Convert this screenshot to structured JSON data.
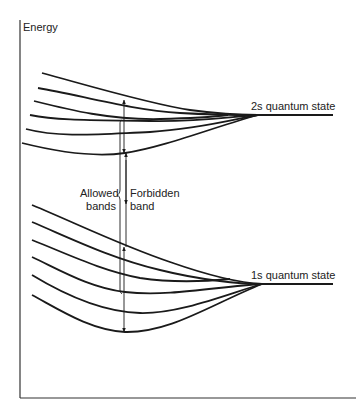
{
  "diagram": {
    "type": "energy band diagram",
    "axis": {
      "y_label": "Energy"
    },
    "labels": {
      "upper_state": "2s quantum state",
      "lower_state": "1s quantum state",
      "allowed_line1": "Allowed",
      "allowed_line2": "bands",
      "forbidden_line1": "Forbidden",
      "forbidden_line2": "band"
    },
    "upper_band": {
      "curve_count": 6,
      "converges_to": "2s quantum state"
    },
    "lower_band": {
      "curve_count": 6,
      "converges_to": "1s quantum state"
    },
    "colors": {
      "line": "#1a1a1a",
      "text": "#222222",
      "background": "#ffffff"
    }
  }
}
